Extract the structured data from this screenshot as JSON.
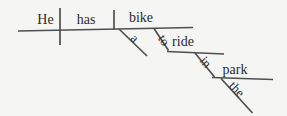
{
  "diagram": {
    "type": "Reed-Kellogg sentence diagram",
    "sentence": "He has a bike to ride in the park",
    "slots": {
      "subject": "He",
      "verb": "has",
      "direct_object": "bike",
      "object_article": "a",
      "infinitive_particle": "to",
      "infinitive_verb": "ride",
      "preposition": "in",
      "object_of_preposition": "park",
      "prep_article": "the"
    }
  },
  "colors": {
    "background": "#f5f5f3",
    "line": "#4f4f4f",
    "text": "#2b2b2b"
  }
}
